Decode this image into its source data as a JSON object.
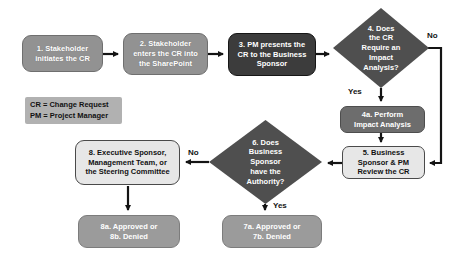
{
  "diagram": {
    "nodes": {
      "n1": {
        "label": "1. Stakeholder\ninitiates the CR"
      },
      "n2": {
        "label": "2. Stakeholder\nenters the CR into\nthe SharePoint"
      },
      "n3": {
        "label": "3. PM presents the\nCR to the Business\nSponsor"
      },
      "n4": {
        "label": "4. Does\nthe CR\nRequire an\nImpact\nAnalysis?"
      },
      "n4a": {
        "label": "4a. Perform\nImpact Analysis"
      },
      "n5": {
        "label": "5. Business\nSponsor & PM\nReview the CR"
      },
      "n6": {
        "label": "6. Does\nBusiness\nSponsor\nhave the\nAuthority?"
      },
      "n7": {
        "label": "7a. Approved or\n7b. Denied"
      },
      "n8": {
        "label": "8. Executive Sponsor,\nManagement Team, or\nthe Steering Committee"
      },
      "n8ab": {
        "label": "8a. Approved or\n8b. Denied"
      }
    },
    "edge_labels": {
      "no4": "No",
      "yes4": "Yes",
      "no6": "No",
      "yes6": "Yes"
    },
    "legend": {
      "text": "CR = Change Request\nPM = Project Manager"
    },
    "colors": {
      "box_medium_gray": "#929292",
      "box_dark_gray": "#3c3c3c",
      "box_mid_gray": "#6d6d6d",
      "box_light_gray": "#e7e7e7",
      "box_result_gray": "#9b9b9b",
      "diamond_gray": "#4f4f4f",
      "legend_gray": "#b1b1b1",
      "arrow_black": "#141414",
      "text_white": "#ffffff",
      "text_black": "#111111"
    }
  }
}
